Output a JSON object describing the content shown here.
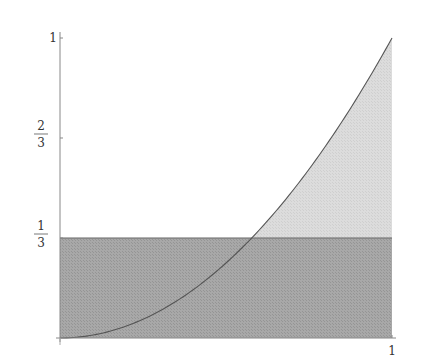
{
  "chart_data": {
    "type": "area",
    "title": "",
    "xlabel": "",
    "ylabel": "",
    "xlim": [
      0,
      1
    ],
    "ylim": [
      0,
      1
    ],
    "grid": false,
    "legend": null,
    "x_ticks": [
      {
        "value": 1,
        "label": "1"
      }
    ],
    "y_ticks": [
      {
        "value": 0.3333,
        "num": "1",
        "den": "3"
      },
      {
        "value": 0.6667,
        "num": "2",
        "den": "3"
      },
      {
        "value": 1,
        "label": "1"
      }
    ],
    "series": [
      {
        "name": "curve y = x^2",
        "style": "line",
        "x": [
          0,
          0.1,
          0.2,
          0.3,
          0.4,
          0.5,
          0.577,
          0.6,
          0.7,
          0.8,
          0.9,
          1.0
        ],
        "y": [
          0,
          0.01,
          0.04,
          0.09,
          0.16,
          0.25,
          0.333,
          0.36,
          0.49,
          0.64,
          0.81,
          1.0
        ]
      },
      {
        "name": "constant y = 1/3",
        "style": "horizontal-line",
        "x": [
          0,
          1
        ],
        "y": [
          0.3333,
          0.3333
        ]
      }
    ],
    "regions": [
      {
        "name": "rectangle below y=1/3",
        "x": [
          0,
          1
        ],
        "y": [
          0,
          0.3333
        ],
        "fill": "#a8a8a8"
      },
      {
        "name": "region under curve above y=1/3",
        "x": [
          0.577,
          1
        ],
        "y_lower": 0.3333,
        "y_upper": "x^2",
        "fill": "#dcdcdc"
      }
    ],
    "annotations": [
      {
        "text": "intersection",
        "x": 0.577,
        "y": 0.3333
      }
    ]
  },
  "colors": {
    "dark_fill": "#a8a8a8",
    "light_fill": "#dcdcdc",
    "curve": "#555555",
    "axis": "#888888",
    "hline": "#666666"
  }
}
